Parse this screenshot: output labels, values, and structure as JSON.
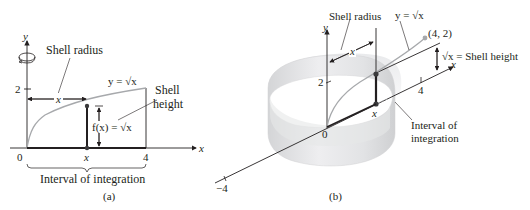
{
  "panel_a": {
    "caption": "(a)",
    "axis_y_label": "y",
    "axis_x_label": "x",
    "tick_y_2": "2",
    "tick_x_0": "0",
    "tick_x_x": "x",
    "tick_x_4": "4",
    "shell_radius_label": "Shell radius",
    "radius_var": "x",
    "curve_label": "y = √x",
    "shell_height_label_line1": "Shell",
    "shell_height_label_line2": "height",
    "fx_label": "f(x) = √x",
    "interval_label": "Interval of integration",
    "rotation_icon": "rotation-arrow-icon"
  },
  "panel_b": {
    "caption": "(b)",
    "axis_y_label": "y",
    "axis_x_label": "x",
    "tick_y_2": "2",
    "tick_origin": "0",
    "tick_x_4": "4",
    "tick_x_neg4": "−4",
    "tick_x_x": "x",
    "shell_radius_label": "Shell radius",
    "radius_var": "x",
    "curve_label": "y = √x",
    "point_label": "(4, 2)",
    "shell_height_label": "√x = Shell height",
    "interval_label_line1": "Interval of",
    "interval_label_line2": "integration"
  },
  "colors": {
    "ink": "#231f20",
    "curve": "#a7a9ac",
    "shell_fill": "#e6e7e8",
    "shell_dark": "#c9cacc",
    "point": "#3a3a3c"
  }
}
